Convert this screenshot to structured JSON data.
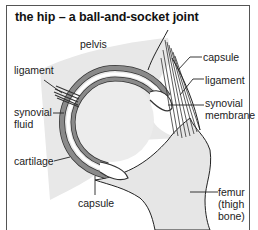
{
  "title": "the hip – a ball-and-socket joint",
  "labels": {
    "pelvis": "pelvis",
    "ligament_left": "ligament",
    "synovial_fluid_1": "synovial",
    "synovial_fluid_2": "fluid",
    "cartilage": "cartilage",
    "capsule_bottom": "capsule",
    "capsule_right": "capsule",
    "ligament_right": "ligament",
    "synovial_membrane_1": "synovial",
    "synovial_membrane_2": "membrane",
    "femur_1": "femur",
    "femur_2": "(thigh",
    "femur_3": "bone)"
  },
  "colors": {
    "bone_fill": "#e6e6e6",
    "cartilage": "#8a8a8a",
    "outline": "#222222",
    "frame": "#555555"
  }
}
